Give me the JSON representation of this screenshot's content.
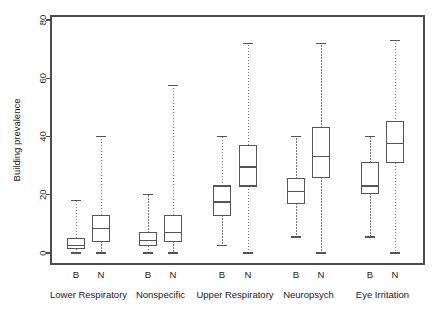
{
  "chart_data": {
    "type": "box",
    "title": "",
    "xlabel": "",
    "ylabel": "Building prevalence",
    "ylim": [
      0,
      80
    ],
    "yticks": [
      0,
      20,
      40,
      60,
      80
    ],
    "ytick_labels": [
      "0",
      "20",
      "40",
      "60",
      "80"
    ],
    "grid": false,
    "legend": "none",
    "subgroup_labels": [
      "B",
      "N"
    ],
    "categories": [
      "Lower Respiratory",
      "Nonspecific",
      "Upper Respiratory",
      "Neuropsych",
      "Eye Irritation"
    ],
    "boxes": [
      {
        "group": "Lower Respiratory",
        "subgroup": "B",
        "min": 0.0,
        "q1": 1.5,
        "median": 2.6,
        "q3": 5.0,
        "max": 18.0
      },
      {
        "group": "Lower Respiratory",
        "subgroup": "N",
        "min": 0.0,
        "q1": 4.0,
        "median": 8.5,
        "q3": 13.0,
        "max": 40.0
      },
      {
        "group": "Nonspecific",
        "subgroup": "B",
        "min": 0.0,
        "q1": 2.5,
        "median": 4.2,
        "q3": 7.0,
        "max": 20.0
      },
      {
        "group": "Nonspecific",
        "subgroup": "N",
        "min": 0.0,
        "q1": 4.0,
        "median": 7.0,
        "q3": 13.0,
        "max": 57.5
      },
      {
        "group": "Upper Respiratory",
        "subgroup": "B",
        "min": 2.5,
        "q1": 13.0,
        "median": 17.5,
        "q3": 23.0,
        "max": 40.0
      },
      {
        "group": "Upper Respiratory",
        "subgroup": "N",
        "min": 0.0,
        "q1": 23.0,
        "median": 29.5,
        "q3": 37.0,
        "max": 72.0
      },
      {
        "group": "Neuropsych",
        "subgroup": "B",
        "min": 5.5,
        "q1": 17.0,
        "median": 21.0,
        "q3": 25.5,
        "max": 40.0
      },
      {
        "group": "Neuropsych",
        "subgroup": "N",
        "min": 0.0,
        "q1": 26.0,
        "median": 33.0,
        "q3": 43.0,
        "max": 72.0
      },
      {
        "group": "Eye Irritation",
        "subgroup": "B",
        "min": 5.5,
        "q1": 20.5,
        "median": 23.0,
        "q3": 31.0,
        "max": 40.0
      },
      {
        "group": "Eye Irritation",
        "subgroup": "N",
        "min": 0.0,
        "q1": 31.0,
        "median": 37.5,
        "q3": 45.0,
        "max": 73.0
      }
    ],
    "colors": {
      "box_stroke": "#555555",
      "box_fill": "#ffffff",
      "whisker": "#777777",
      "frame": "#4d4d4d",
      "text": "#1a1a1a",
      "background": "#ffffff"
    }
  }
}
